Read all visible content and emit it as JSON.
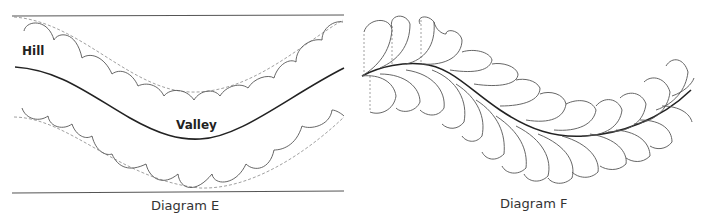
{
  "diagram_e": {
    "caption": "Diagram E",
    "labels": {
      "hill": "Hill",
      "valley": "Valley"
    }
  },
  "diagram_f": {
    "caption": "Diagram F"
  },
  "colors": {
    "line": "#333333",
    "dashed": "#888888",
    "background": "#ffffff"
  }
}
